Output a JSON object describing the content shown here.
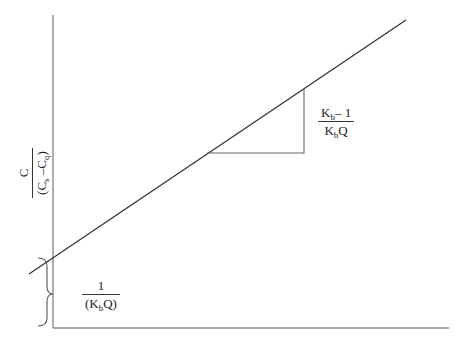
{
  "diagram": {
    "type": "linear-plot-schematic",
    "y_axis_label": {
      "numerator": "C",
      "denominator_parts": [
        "(C",
        "s",
        " –C",
        "q",
        ")"
      ]
    },
    "slope_label": {
      "numerator_parts": [
        "K",
        "b",
        "– 1"
      ],
      "denominator_parts": [
        "K",
        "b",
        "Q"
      ]
    },
    "intercept_label": {
      "numerator": "1",
      "denominator_parts": [
        "(K",
        "b",
        "Q)"
      ]
    },
    "colors": {
      "line": "#333333",
      "axes": "#888888",
      "triangle": "#666666",
      "text": "#222222"
    }
  }
}
